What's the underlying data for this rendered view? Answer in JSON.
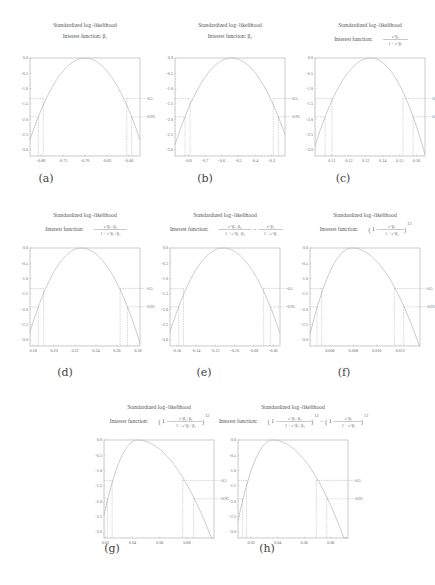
{
  "chart_data": [
    {
      "id": "a",
      "type": "line",
      "label": "(a)",
      "title": "Standardized log−likelihood",
      "subtitle": "Interest function: β₁",
      "x_ticks": [
        "-0.80",
        "-0.75",
        "-0.70",
        "-0.65",
        "-0.60"
      ],
      "xlim": [
        -0.825,
        -0.575
      ],
      "peak_x": -0.7,
      "y_ticks": [
        "0.0",
        "-0.5",
        "-1.0",
        "-1.5",
        "-2.0",
        "-2.5",
        "-3.0"
      ],
      "ylim": [
        -3.2,
        0.0
      ],
      "cutoff_labels": [
        "-0.5",
        "-0.95"
      ],
      "ci_50": [
        -0.795,
        -0.605
      ],
      "ci_95": [
        -0.806,
        -0.594
      ],
      "skew": 0.0
    },
    {
      "id": "b",
      "type": "line",
      "label": "(b)",
      "title": "Standardized log−likelihood",
      "subtitle": "Interest function: β₂",
      "x_ticks": [
        "-0.8",
        "-0.7",
        "-0.6",
        "-0.5",
        "-0.4",
        "-0.3"
      ],
      "xlim": [
        -0.88,
        -0.22
      ],
      "peak_x": -0.54,
      "y_ticks": [
        "0.0",
        "-0.5",
        "-1.0",
        "-1.5",
        "-2.0",
        "-2.5",
        "-3.0"
      ],
      "ylim": [
        -3.2,
        0.0
      ],
      "cutoff_labels": [
        "-0.5",
        "-0.95"
      ],
      "ci_50": [
        -0.79,
        -0.29
      ],
      "ci_95": [
        -0.82,
        -0.26
      ],
      "skew": 0.0
    },
    {
      "id": "c",
      "type": "line",
      "label": "(c)",
      "title": "Standardized log−likelihood",
      "subtitle": "Interest function:",
      "subtitle_frac": {
        "num": "e^β₁",
        "den": "1 + e^β₁"
      },
      "x_ticks": [
        "0.11",
        "0.12",
        "0.13",
        "0.14",
        "0.15",
        "0.16"
      ],
      "xlim": [
        0.1,
        0.165
      ],
      "peak_x": 0.133,
      "y_ticks": [
        "0.0",
        "-0.5",
        "-1.0",
        "-1.5",
        "-2.0",
        "-2.5",
        "-3.0"
      ],
      "ylim": [
        -3.2,
        0.0
      ],
      "cutoff_labels": [
        "-0.5",
        "-0.95"
      ],
      "ci_50": [
        0.11,
        0.152
      ],
      "ci_95": [
        0.106,
        0.158
      ],
      "skew": 0.0
    },
    {
      "id": "d",
      "type": "line",
      "label": "(d)",
      "title": "Standardized log−likelihood",
      "subtitle": "Interest function:",
      "subtitle_frac": {
        "num": "e^β₁+β₂",
        "den": "1 + e^β₁+β₂"
      },
      "x_ticks": [
        "0.18",
        "0.20",
        "0.22",
        "0.24",
        "0.26",
        "0.28"
      ],
      "xlim": [
        0.177,
        0.282
      ],
      "peak_x": 0.226,
      "y_ticks": [
        "0.0",
        "-0.5",
        "-1.0",
        "-1.5",
        "-2.0",
        "-2.5",
        "-3.0"
      ],
      "ylim": [
        -3.2,
        0.0
      ],
      "cutoff_labels": [
        "-0.5",
        "-0.95"
      ],
      "ci_50": [
        0.19,
        0.263
      ],
      "ci_95": [
        0.185,
        0.27
      ],
      "skew": 0.0
    },
    {
      "id": "e",
      "type": "line",
      "label": "(e)",
      "title": "Standardized log−likelihood",
      "subtitle": "Interest function:",
      "subtitle_frac": {
        "num": "e^β₁+β₂",
        "den": "1 + e^β₁+β₂"
      },
      "subtitle_frac2": {
        "num": "e^β₁",
        "den": "1 + e^β₁"
      },
      "x_ticks": [
        "-0.16",
        "-0.14",
        "-0.12",
        "-0.10",
        "-0.08",
        "-0.06"
      ],
      "xlim": [
        -0.167,
        -0.053
      ],
      "peak_x": -0.112,
      "y_ticks": [
        "0.0",
        "-0.5",
        "-1.0",
        "-1.5",
        "-2.0",
        "-2.5",
        "-3.0"
      ],
      "ylim": [
        -3.2,
        0.0
      ],
      "cutoff_labels": [
        "-0.5",
        "-0.95"
      ],
      "ci_50": [
        -0.153,
        -0.07
      ],
      "ci_95": [
        -0.158,
        -0.063
      ],
      "skew": 0.0
    },
    {
      "id": "f",
      "type": "line",
      "label": "(f)",
      "title": "Standardized log−likelihood",
      "subtitle": "Interest function:",
      "subtitle_pow": {
        "num": "e^β₁",
        "den": "1 + e^β₁",
        "exp": "12"
      },
      "x_ticks": [
        "0.006",
        "0.008",
        "0.010",
        "0.012"
      ],
      "xlim": [
        0.0043,
        0.0137
      ],
      "peak_x": 0.0079,
      "y_ticks": [
        "0.0",
        "-0.5",
        "-1.0",
        "-1.5",
        "-2.0",
        "-2.5",
        "-3.0"
      ],
      "ylim": [
        -3.2,
        0.0
      ],
      "cutoff_labels": [
        "-0.5",
        "-0.95"
      ],
      "ci_50": [
        0.0053,
        0.0115
      ],
      "ci_95": [
        0.0049,
        0.0123
      ],
      "skew": 0.35
    },
    {
      "id": "g",
      "type": "line",
      "label": "(g)",
      "title": "Standardized log−likelihood",
      "subtitle": "Interest function:",
      "subtitle_pow": {
        "num": "e^β₁+β₂",
        "den": "1 + e^β₁+β₂",
        "exp": "12"
      },
      "x_ticks": [
        "0.02",
        "0.04",
        "0.06",
        "0.08"
      ],
      "xlim": [
        0.019,
        0.1
      ],
      "peak_x": 0.0435,
      "y_ticks": [
        "0.0",
        "-0.5",
        "-1.0",
        "-1.5",
        "-2.0",
        "-2.5",
        "-3.0"
      ],
      "ylim": [
        -3.2,
        0.0
      ],
      "cutoff_labels": [
        "-0.5",
        "-0.95"
      ],
      "ci_50": [
        0.025,
        0.077
      ],
      "ci_95": [
        0.0215,
        0.085
      ],
      "skew": 0.55
    },
    {
      "id": "h",
      "type": "line",
      "label": "(h)",
      "title": "Standardized log−likelihood",
      "subtitle": "Interest function:",
      "subtitle_pow": {
        "num": "e^β₁+β₂",
        "den": "1 + e^β₁+β₂",
        "exp": "12"
      },
      "subtitle_pow2": {
        "num": "e^β₁",
        "den": "1 + e^β₁",
        "exp": "12"
      },
      "x_ticks": [
        "0.02",
        "0.04",
        "0.06",
        "0.08"
      ],
      "xlim": [
        0.01,
        0.093
      ],
      "peak_x": 0.036,
      "y_ticks": [
        "0.0",
        "-0.5",
        "-1.0",
        "-1.5",
        "-2.0",
        "-2.5",
        "-3.0"
      ],
      "ylim": [
        -3.2,
        0.0
      ],
      "cutoff_labels": [
        "-0.5",
        "-0.95"
      ],
      "ci_50": [
        0.0165,
        0.069
      ],
      "ci_95": [
        0.0135,
        0.077
      ],
      "skew": 0.55
    }
  ],
  "layout": [
    {
      "id": "a",
      "x": 8,
      "y": 18,
      "label_x": 38,
      "label_y": 178
    },
    {
      "id": "b",
      "x": 153,
      "y": 18,
      "label_x": 197,
      "label_y": 178
    },
    {
      "id": "c",
      "x": 293,
      "y": 18,
      "label_x": 335,
      "label_y": 178
    },
    {
      "id": "d",
      "x": 8,
      "y": 208,
      "label_x": 57,
      "label_y": 372
    },
    {
      "id": "e",
      "x": 148,
      "y": 208,
      "label_x": 196,
      "label_y": 372
    },
    {
      "id": "f",
      "x": 288,
      "y": 208,
      "label_x": 336,
      "label_y": 372
    },
    {
      "id": "g",
      "x": 82,
      "y": 400,
      "label_x": 104,
      "label_y": 548
    },
    {
      "id": "h",
      "x": 216,
      "y": 400,
      "label_x": 259,
      "label_y": 548
    }
  ]
}
